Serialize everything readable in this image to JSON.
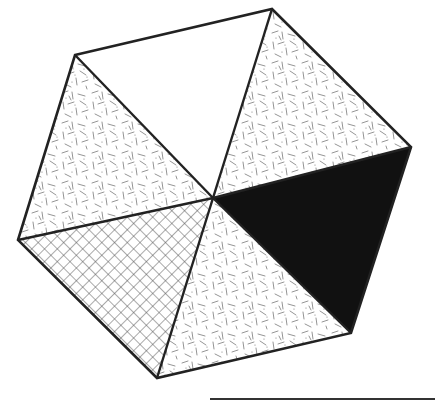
{
  "diagram": {
    "type": "hexagon-divided-into-triangles",
    "center": [
      213,
      198
    ],
    "vertices": [
      [
        75,
        55
      ],
      [
        272,
        9
      ],
      [
        411,
        147
      ],
      [
        351,
        333
      ],
      [
        157,
        378
      ],
      [
        18,
        240
      ]
    ],
    "stroke_color": "#222222",
    "sectors": [
      {
        "name": "top",
        "fill": "blank",
        "color": "#ffffff"
      },
      {
        "name": "upper-right",
        "fill": "dash-texture",
        "color": "#ffffff"
      },
      {
        "name": "lower-right",
        "fill": "solid",
        "color": "#111111"
      },
      {
        "name": "bottom",
        "fill": "dash-texture",
        "color": "#ffffff"
      },
      {
        "name": "lower-left",
        "fill": "crosshatch",
        "color": "#ffffff"
      },
      {
        "name": "upper-left",
        "fill": "dash-texture",
        "color": "#ffffff"
      }
    ],
    "baseline": {
      "x1": 210,
      "x2": 435,
      "y": 399
    }
  }
}
